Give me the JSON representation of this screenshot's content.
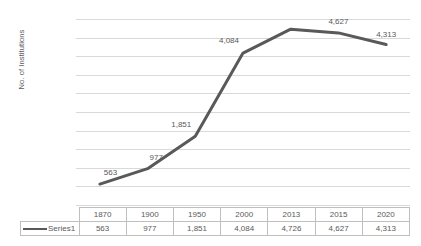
{
  "chart_data": {
    "type": "line",
    "title": "",
    "xlabel": "",
    "ylabel": "No. of Institutions",
    "categories": [
      "1870",
      "1900",
      "1950",
      "2000",
      "2013",
      "2015",
      "2020"
    ],
    "series": [
      {
        "name": "Series1",
        "values": [
          563,
          977,
          1851,
          4084,
          4726,
          4627,
          4313
        ],
        "value_labels": [
          "563",
          "977",
          "1,851",
          "4,084",
          "4,726",
          "4,627",
          "4,313"
        ],
        "color": "#595959"
      }
    ],
    "point_labels_shown": [
      {
        "category": "1870",
        "text": "563",
        "shown": true
      },
      {
        "category": "1900",
        "text": "977",
        "shown": true
      },
      {
        "category": "1950",
        "text": "1,851",
        "shown": true
      },
      {
        "category": "2000",
        "text": "4,084",
        "shown": true
      },
      {
        "category": "2013",
        "text": "4,726",
        "shown": false
      },
      {
        "category": "2015",
        "text": "4,627",
        "shown": true
      },
      {
        "category": "2020",
        "text": "4,313",
        "shown": true
      }
    ],
    "ylim": [
      0,
      5000
    ],
    "ytick_step": 500,
    "ytick_labels": [
      "5,000",
      "4,500",
      "4,000",
      "3,500",
      "3,000",
      "2,500",
      "2,000",
      "1,500",
      "1,000",
      "500",
      "0"
    ],
    "grid": true,
    "grid_color": "#d9d9d9",
    "legend_position": "data-table-row",
    "data_table_shown": true
  },
  "data_table": {
    "legend_blank_label": "",
    "series_row_label": "Series1",
    "header_cells": [
      "1870",
      "1900",
      "1950",
      "2000",
      "2013",
      "2015",
      "2020"
    ],
    "value_cells": [
      "563",
      "977",
      "1,851",
      "4,084",
      "4,726",
      "4,627",
      "4,313"
    ]
  }
}
